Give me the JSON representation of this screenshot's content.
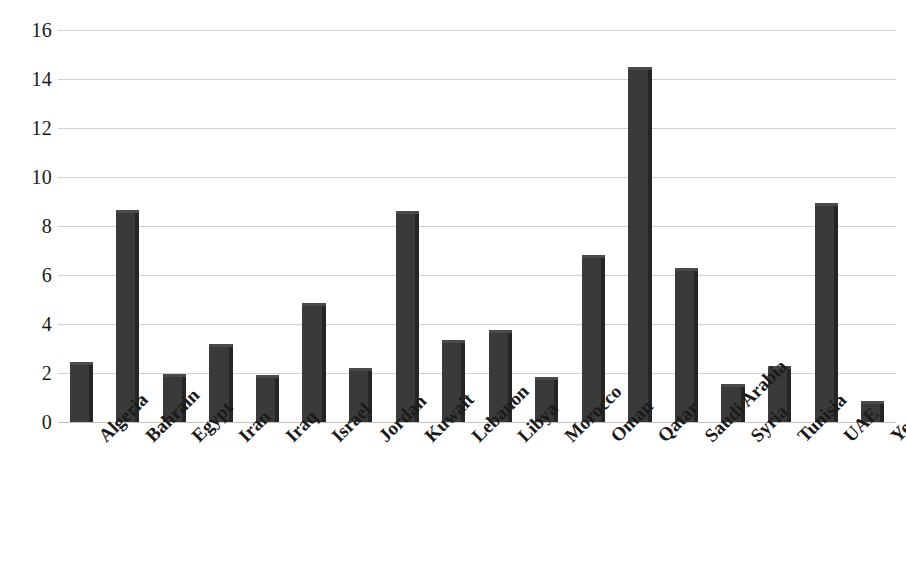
{
  "chart_data": {
    "type": "bar",
    "title": "",
    "subtitle": "",
    "xlabel": "",
    "ylabel": "",
    "ylim": [
      0,
      16
    ],
    "ytick_step": 2,
    "grid": true,
    "legend": "none",
    "bar_color": "#3a3a3a",
    "gridline_color": "#c9c9c9",
    "categories": [
      "Algeria",
      "Bahrain",
      "Egypt",
      "Iran",
      "Iraq",
      "Israel",
      "Jordan",
      "Kuwait",
      "Lebanon",
      "Libya",
      "Morocco",
      "Oman",
      "Qatar",
      "Saudi Arabia",
      "Syria",
      "Tunisia",
      "UAE",
      "Yemen"
    ],
    "values": [
      2.45,
      8.65,
      1.95,
      3.2,
      1.9,
      4.85,
      2.2,
      8.6,
      3.35,
      3.75,
      1.85,
      6.8,
      14.5,
      6.3,
      1.55,
      2.3,
      8.95,
      0.85
    ],
    "ytick_labels": [
      "16",
      "14",
      "12",
      "10",
      "8",
      "6",
      "4",
      "2",
      "0"
    ],
    "ytick_values": [
      16,
      14,
      12,
      10,
      8,
      6,
      4,
      2,
      0
    ]
  }
}
